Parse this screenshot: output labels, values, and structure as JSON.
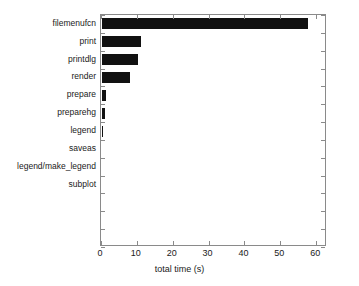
{
  "chart_data": {
    "type": "bar",
    "orientation": "horizontal",
    "title": "",
    "xlabel": "total time (s)",
    "ylabel": "",
    "xlim": [
      0,
      63
    ],
    "ylim": [
      0,
      13
    ],
    "grid": false,
    "legend": null,
    "bar_color": "#111111",
    "axis_color": "#8a8a8a",
    "xticks": [
      0,
      10,
      20,
      30,
      40,
      50,
      60
    ],
    "xtick_labels": [
      "0",
      "10",
      "20",
      "30",
      "40",
      "50",
      "60"
    ],
    "categories": [
      "filemenufcn",
      "print",
      "printdlg",
      "render",
      "prepare",
      "preparehg",
      "legend",
      "saveas",
      "legend/make_legend",
      "subplot"
    ],
    "values": [
      58.0,
      11.3,
      10.7,
      8.3,
      1.8,
      1.5,
      0.8,
      0.6,
      0.6,
      0.5
    ]
  }
}
